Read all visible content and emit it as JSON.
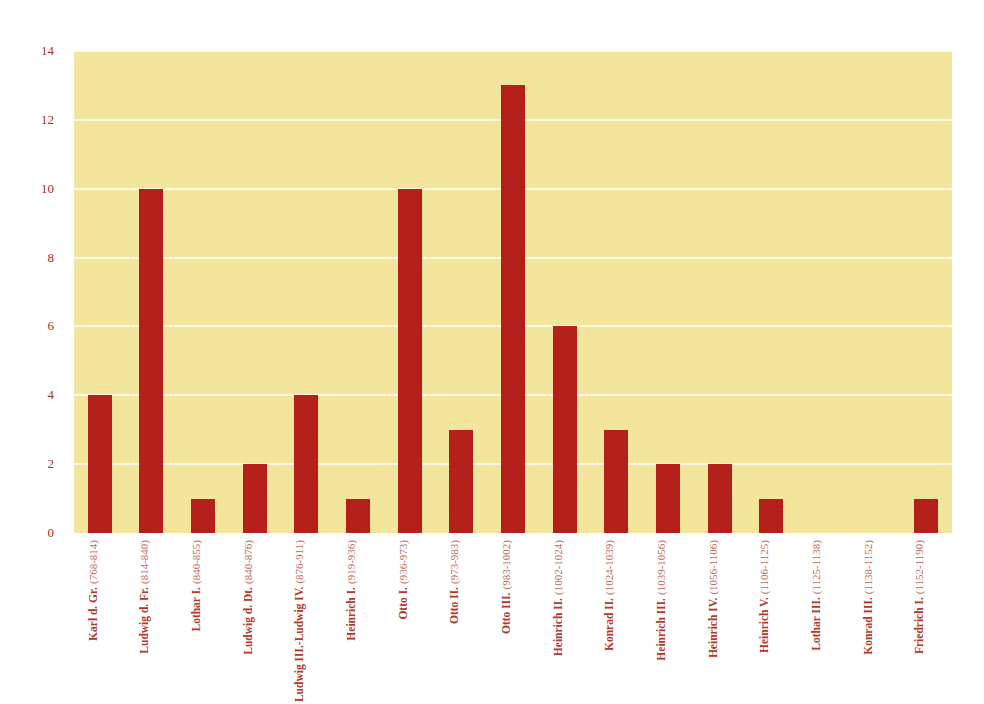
{
  "chart_data": {
    "type": "bar",
    "title": "",
    "subtitle": "",
    "xlabel": "",
    "ylabel": "",
    "ylim": [
      0,
      14
    ],
    "ytick_values": [
      0,
      2,
      4,
      6,
      8,
      10,
      12,
      14
    ],
    "ytick_labels": [
      "0",
      "2",
      "4",
      "6",
      "8",
      "10",
      "12",
      "14"
    ],
    "grid": true,
    "grid_axis": "y",
    "legend": false,
    "legend_position": "none",
    "categories": [
      "Karl d. Gr. (768-814)",
      "Ludwig d. Fr. (814-840)",
      "Lothar I. (840-855)",
      "Ludwig d. Dt. (840-876)",
      "Ludwig III.-Ludwig IV. (876-911)",
      "Heinrich I. (919-936)",
      "Otto I. (936-973)",
      "Otto II. (973-983)",
      "Otto III. (983-1002)",
      "Heinrich II. (1002-1024)",
      "Konrad II. (1024-1039)",
      "Heinrich III. (1039-1056)",
      "Heinrich IV. (1056-1106)",
      "Heinrich V. (1106-1125)",
      "Lothar III. (1125-1138)",
      "Konrad III. (1138-1152)",
      "Friedrich I. (1152-1190)"
    ],
    "category_names": [
      "Karl d. Gr.",
      "Ludwig d. Fr.",
      "Lothar I.",
      "Ludwig d. Dt.",
      "Ludwig III.-Ludwig IV.",
      "Heinrich I.",
      "Otto I.",
      "Otto II.",
      "Otto III.",
      "Heinrich II.",
      "Konrad II.",
      "Heinrich III.",
      "Heinrich IV.",
      "Heinrich V.",
      "Lothar III.",
      "Konrad III.",
      "Friedrich I."
    ],
    "category_years": [
      "(768-814)",
      "(814-840)",
      "(840-855)",
      "(840-876)",
      "(876-911)",
      "(919-936)",
      "(936-973)",
      "(973-983)",
      "(983-1002)",
      "(1002-1024)",
      "(1024-1039)",
      "(1039-1056)",
      "(1056-1106)",
      "(1106-1125)",
      "(1125-1138)",
      "(1138-1152)",
      "(1152-1190)"
    ],
    "values": [
      4,
      10,
      1,
      2,
      4,
      1,
      10,
      3,
      13,
      6,
      3,
      2,
      2,
      1,
      0,
      0,
      1
    ]
  },
  "style": {
    "bar_color": "#b5201b",
    "plot_background": "#f3e69c",
    "gridline_color": "#fdf9e2",
    "ytick_color": "#a3302a",
    "xlabel_name_color": "#b03a2c",
    "xlabel_year_color": "#c1685b",
    "page_background": "#ffffff"
  }
}
